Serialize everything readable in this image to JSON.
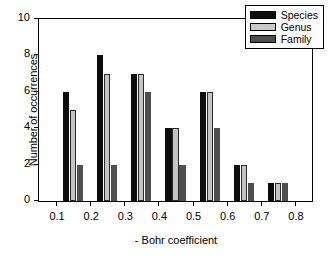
{
  "chart_data": {
    "type": "bar",
    "title": "",
    "xlabel": "- Bohr coefficient",
    "ylabel": "Number of occurrences",
    "xlim": [
      0.05,
      0.85
    ],
    "ylim": [
      0,
      10
    ],
    "xticks": [
      "0.1",
      "0.2",
      "0.3",
      "0.4",
      "0.5",
      "0.6",
      "0.7",
      "0.8"
    ],
    "xtick_values": [
      0.1,
      0.2,
      0.3,
      0.4,
      0.5,
      0.6,
      0.7,
      0.8
    ],
    "yticks": [
      "0",
      "2",
      "4",
      "6",
      "8",
      "10"
    ],
    "ytick_values": [
      0,
      2,
      4,
      6,
      8,
      10
    ],
    "grid": false,
    "legend_position": "top-right",
    "bin_centers": [
      0.15,
      0.25,
      0.35,
      0.45,
      0.55,
      0.65,
      0.75
    ],
    "categories": [
      "0.15",
      "0.25",
      "0.35",
      "0.45",
      "0.55",
      "0.65",
      "0.75"
    ],
    "series": [
      {
        "name": "Species",
        "color": "#0d0d0d",
        "values": [
          6,
          8,
          7,
          4,
          6,
          2,
          1
        ]
      },
      {
        "name": "Genus",
        "color": "#c9c9c9",
        "values": [
          5,
          7,
          7,
          4,
          6,
          2,
          1
        ]
      },
      {
        "name": "Family",
        "color": "#4f4f4f",
        "values": [
          2,
          2,
          6,
          2,
          4,
          1,
          1
        ]
      }
    ]
  },
  "legend": {
    "items": [
      {
        "label": "Species"
      },
      {
        "label": "Genus"
      },
      {
        "label": "Family"
      }
    ]
  }
}
